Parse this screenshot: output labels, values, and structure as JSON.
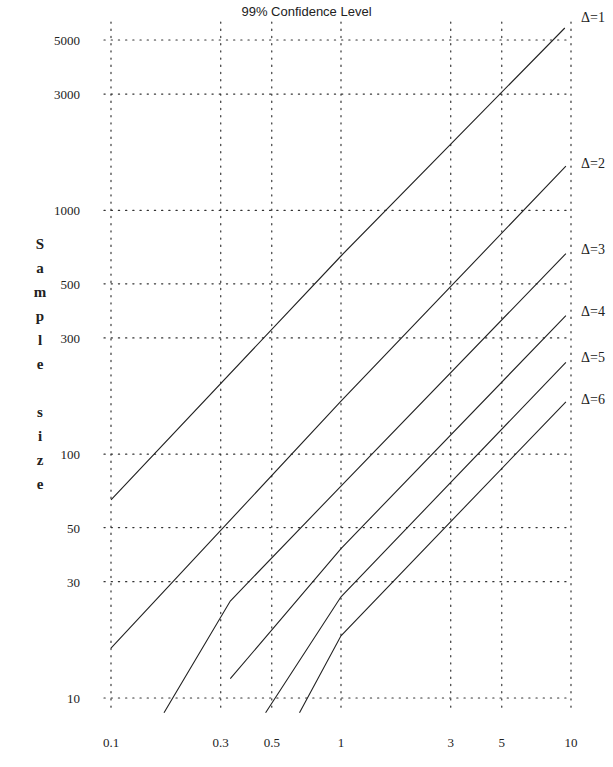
{
  "chart_data": {
    "type": "line",
    "title": "99% Confidence Level",
    "xlabel": "",
    "ylabel": "Sample size",
    "xscale": "log",
    "yscale": "log",
    "xlim": [
      0.1,
      10
    ],
    "ylim": [
      10,
      5000
    ],
    "x_ticks": [
      "0.1",
      "0.3",
      "0.5",
      "1",
      "3",
      "5",
      "10"
    ],
    "y_ticks": [
      "10",
      "30",
      "50",
      "100",
      "300",
      "500",
      "1000",
      "3000",
      "5000"
    ],
    "grid": "dotted",
    "legend_position": "right, inline labels at line ends",
    "series": [
      {
        "name": "Δ=1",
        "points": [
          [
            0.1,
            65
          ],
          [
            1,
            650
          ],
          [
            9.4,
            5600
          ]
        ]
      },
      {
        "name": "Δ=2",
        "points": [
          [
            0.1,
            16
          ],
          [
            1,
            165
          ],
          [
            9.5,
            1520
          ]
        ]
      },
      {
        "name": "Δ=3",
        "points": [
          [
            0.17,
            8.7
          ],
          [
            0.33,
            25
          ],
          [
            1,
            74
          ],
          [
            9.5,
            665
          ]
        ]
      },
      {
        "name": "Δ=4",
        "points": [
          [
            0.33,
            12
          ],
          [
            1,
            41
          ],
          [
            9.5,
            370
          ]
        ]
      },
      {
        "name": "Δ=5",
        "points": [
          [
            0.47,
            8.7
          ],
          [
            1,
            26
          ],
          [
            9.5,
            238
          ]
        ]
      },
      {
        "name": "Δ=6",
        "points": [
          [
            0.66,
            8.7
          ],
          [
            1,
            18
          ],
          [
            9.5,
            164
          ]
        ]
      }
    ]
  },
  "labels": {
    "title": "99% Confidence Level",
    "ylabel_letters": [
      "S",
      "a",
      "m",
      "p",
      "l",
      "e",
      "",
      "s",
      "i",
      "z",
      "e"
    ]
  }
}
